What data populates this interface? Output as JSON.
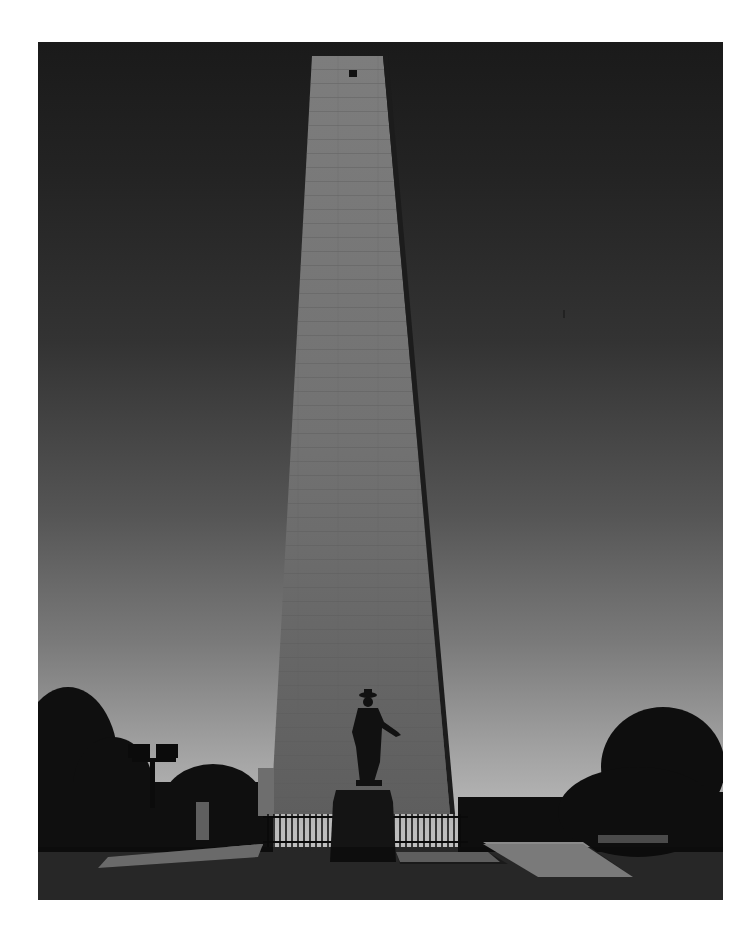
{
  "photo": {
    "subject": "obelisk monument with statue",
    "style": "black-and-white photograph",
    "elements": [
      "obelisk",
      "statue",
      "pedestal",
      "iron-fence",
      "trees",
      "floodlight-pole",
      "stone-posts",
      "paved-walkways",
      "bench",
      "buildings"
    ]
  },
  "colors": {
    "sky_top": "#1a1a1a",
    "sky_bottom": "#c4c4c4",
    "stone": "#8a8a8a",
    "silhouette": "#0d0d0d",
    "border": "#ffffff"
  }
}
